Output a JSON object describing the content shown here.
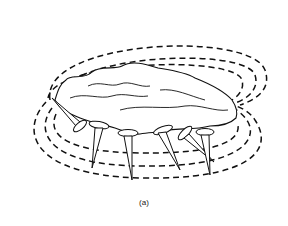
{
  "figure": {
    "caption": "(a)",
    "elements": {
      "magnet": "irregular rock (lodestone)",
      "field_lines": 6,
      "tacks": 6
    },
    "colors": {
      "line": "#111111",
      "background": "#ffffff"
    }
  }
}
